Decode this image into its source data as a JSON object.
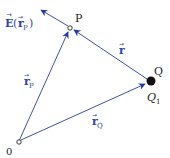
{
  "diagram": {
    "type": "vector-diagram",
    "colors": {
      "vector_line": "#3d54a6",
      "arrowhead": "#1f3a9e",
      "label_dark": "#222222",
      "label_blue": "#2f47a0",
      "charge_fill": "#111111"
    },
    "points": {
      "origin": {
        "label": "0"
      },
      "P": {
        "label": "P"
      },
      "Q": {
        "label": "Q",
        "sublabel_main": "Q",
        "sublabel_sub": "1"
      }
    },
    "vectors": {
      "E_field": {
        "label_main": "E",
        "label_arg": "r",
        "label_sub": "P",
        "full": "E(r_P)"
      },
      "r": {
        "label": "r"
      },
      "r_P": {
        "label": "r",
        "sub": "P"
      },
      "r_Q": {
        "label": "r",
        "sub": "Q"
      }
    }
  }
}
